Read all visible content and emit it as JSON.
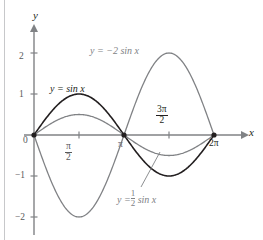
{
  "figure": {
    "background": "#ffffff",
    "axis_color": "#808285",
    "margin_rule_color": "#c7c8ca"
  },
  "axes": {
    "x_axis_label": "x",
    "y_axis_label": "y",
    "origin_label": "0",
    "y_ticks": [
      {
        "value": 2,
        "label": "2"
      },
      {
        "value": 1,
        "label": "1"
      },
      {
        "value": -1,
        "label": "−1"
      },
      {
        "value": -2,
        "label": "−2"
      }
    ],
    "x_ticks": [
      {
        "value": 1.5707963,
        "label": "π/2",
        "num": "π",
        "den": "2"
      },
      {
        "value": 3.1415927,
        "label": "π"
      },
      {
        "value": 4.712389,
        "label": "3π/2",
        "num": "3π",
        "den": "2"
      },
      {
        "value": 6.2831853,
        "label": "2π"
      }
    ]
  },
  "labels": {
    "sin": "y = sin x",
    "neg_two_sin": "y = −2 sin x",
    "half_sin_prefix": "y =",
    "half_sin_num": "1",
    "half_sin_den": "2",
    "half_sin_suffix": "sin x"
  },
  "chart_data": {
    "type": "line",
    "title": "",
    "xlabel": "x",
    "ylabel": "y",
    "xlim": [
      0,
      6.2831853
    ],
    "ylim": [
      -2.4,
      2.4
    ],
    "xtick_values": [
      1.5707963,
      3.1415927,
      4.712389,
      6.2831853
    ],
    "xtick_labels": [
      "π/2",
      "π",
      "3π/2",
      "2π"
    ],
    "ytick_values": [
      2,
      1,
      -1,
      -2
    ],
    "ytick_labels": [
      "2",
      "1",
      "−1",
      "−2"
    ],
    "grid": false,
    "legend": "inline-annotations",
    "series": [
      {
        "name": "y = sin x",
        "color": "#231f20",
        "amplitude": 1,
        "linewidth": 1.6,
        "x": [
          0,
          0.3927,
          0.7854,
          1.1781,
          1.5708,
          1.9635,
          2.3562,
          2.7489,
          3.1416,
          3.5343,
          3.927,
          4.3197,
          4.7124,
          5.1051,
          5.4978,
          5.8905,
          6.2832
        ],
        "values": [
          0,
          0.3827,
          0.7071,
          0.9239,
          1,
          0.9239,
          0.7071,
          0.3827,
          0,
          -0.3827,
          -0.7071,
          -0.9239,
          -1,
          -0.9239,
          -0.7071,
          -0.3827,
          0
        ]
      },
      {
        "name": "y = 1/2 sin x",
        "color": "#808285",
        "amplitude": 0.5,
        "linewidth": 1.3,
        "x": [
          0,
          0.3927,
          0.7854,
          1.1781,
          1.5708,
          1.9635,
          2.3562,
          2.7489,
          3.1416,
          3.5343,
          3.927,
          4.3197,
          4.7124,
          5.1051,
          5.4978,
          5.8905,
          6.2832
        ],
        "values": [
          0,
          0.1913,
          0.3536,
          0.4619,
          0.5,
          0.4619,
          0.3536,
          0.1913,
          0,
          -0.1913,
          -0.3536,
          -0.4619,
          -0.5,
          -0.4619,
          -0.3536,
          -0.1913,
          0
        ]
      },
      {
        "name": "y = −2 sin x",
        "color": "#808285",
        "amplitude": -2,
        "linewidth": 1.3,
        "x": [
          0,
          0.3927,
          0.7854,
          1.1781,
          1.5708,
          1.9635,
          2.3562,
          2.7489,
          3.1416,
          3.5343,
          3.927,
          4.3197,
          4.7124,
          5.1051,
          5.4978,
          5.8905,
          6.2832
        ],
        "values": [
          0,
          -0.7654,
          -1.4142,
          -1.8478,
          -2,
          -1.8478,
          -1.4142,
          -0.7654,
          0,
          0.7654,
          1.4142,
          1.8478,
          2,
          1.8478,
          1.4142,
          0.7654,
          0
        ]
      }
    ],
    "marked_points": [
      {
        "x": 0,
        "y": 0
      },
      {
        "x": 3.1415927,
        "y": 0
      },
      {
        "x": 6.2831853,
        "y": 0
      }
    ]
  }
}
